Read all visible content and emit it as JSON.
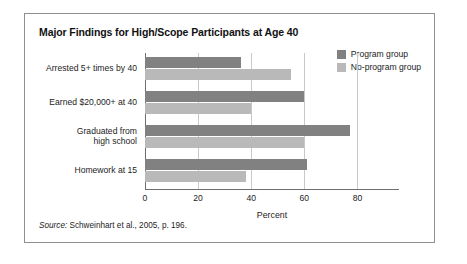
{
  "figure": {
    "title": "Major Findings for High/Scope Participants at Age 40",
    "source_label": "Source:",
    "source_text": " Schweinhart et al., 2005, p. 196."
  },
  "legend": {
    "position": "top-right",
    "items": [
      {
        "label": "Program group",
        "color": "#818181"
      },
      {
        "label": "No-program group",
        "color": "#b9b9b9"
      }
    ]
  },
  "chart_data": {
    "type": "bar",
    "orientation": "horizontal",
    "title": "Major Findings for High/Scope Participants at Age 40",
    "xlabel": "Percent",
    "ylabel": "",
    "xlim": [
      0,
      93
    ],
    "xticks": [
      0,
      20,
      40,
      60,
      80
    ],
    "xtick_labels": [
      "0",
      "20",
      "40",
      "60",
      "80"
    ],
    "grid": true,
    "grid_axis": "x",
    "categories": [
      "Arrested 5+ times by 40",
      "Earned $20,000+ at 40",
      "Graduated from high school",
      "Homework at 15"
    ],
    "category_label_lines": [
      [
        "Arrested 5+ times by 40"
      ],
      [
        "Earned $20,000+ at 40"
      ],
      [
        "Graduated from",
        "high school"
      ],
      [
        "Homework at 15"
      ]
    ],
    "series": [
      {
        "name": "Program group",
        "color": "#818181",
        "values": [
          36,
          60,
          77,
          61
        ]
      },
      {
        "name": "No-program group",
        "color": "#b9b9b9",
        "values": [
          55,
          40,
          60,
          38
        ]
      }
    ]
  }
}
